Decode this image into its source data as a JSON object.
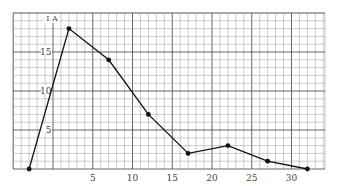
{
  "chart_data": {
    "type": "line",
    "title": "",
    "xlabel": "",
    "ylabel": "I A",
    "x": [
      -3,
      2,
      7,
      12,
      17,
      22,
      27,
      32
    ],
    "series": [
      {
        "name": "I",
        "values": [
          0,
          18,
          14,
          7,
          2,
          3,
          1,
          0
        ]
      }
    ],
    "x_ticks": [
      5,
      10,
      15,
      20,
      25,
      30
    ],
    "y_ticks": [
      5,
      10,
      15
    ],
    "xlim": [
      -5,
      35
    ],
    "ylim": [
      0,
      20
    ],
    "grid": true,
    "legend": "none",
    "colors": {
      "line": "#111111",
      "grid_minor": "#9a9a9a",
      "grid_major": "#555555",
      "background": "#ffffff"
    }
  }
}
